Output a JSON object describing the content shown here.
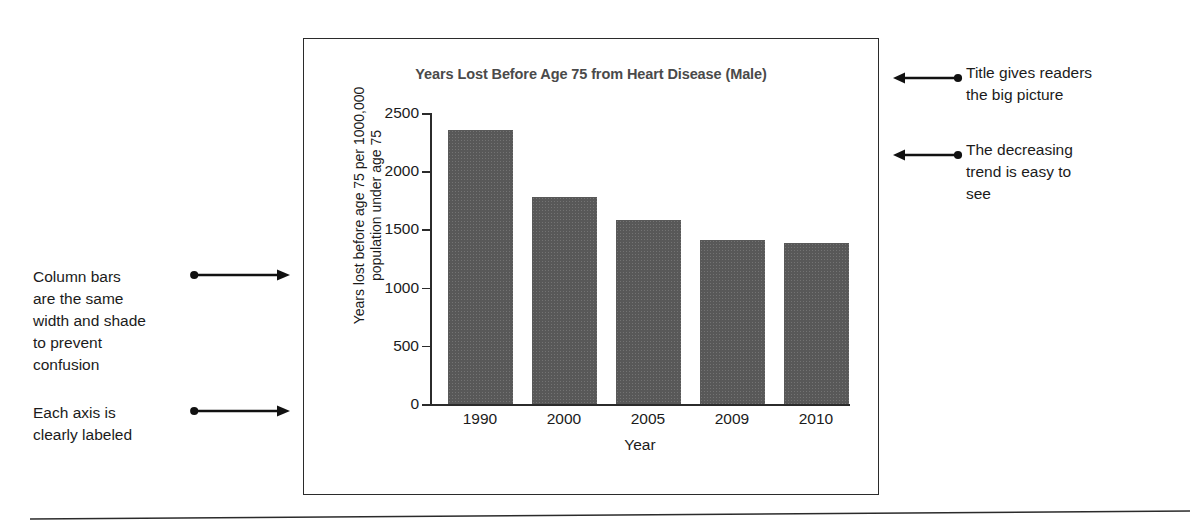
{
  "figure": {
    "chart_title": "Years Lost Before Age 75 from Heart Disease (Male)",
    "y_axis_title_line1": "Years lost before age 75 per 1000,000",
    "y_axis_title_line2": "population under age 75",
    "x_axis_title": "Year",
    "y_ticks": [
      "2500",
      "2000",
      "1500",
      "1000",
      "500",
      "0"
    ],
    "x_ticks": [
      "1990",
      "2000",
      "2005",
      "2009",
      "2010"
    ],
    "bar_color": "#585858",
    "axis_color": "#2b2b2b",
    "border_color": "#2b2b2b"
  },
  "chart_data": {
    "type": "bar",
    "title": "Years Lost Before Age 75 from Heart Disease (Male)",
    "xlabel": "Year",
    "ylabel": "Years lost before age 75 per 1000,000 population under age 75",
    "categories": [
      "1990",
      "2000",
      "2005",
      "2009",
      "2010"
    ],
    "values": [
      2350,
      1780,
      1580,
      1410,
      1380
    ],
    "ylim": [
      0,
      2500
    ],
    "ytick_values": [
      0,
      500,
      1000,
      1500,
      2000,
      2500
    ],
    "grid": false,
    "legend": false,
    "series": [
      {
        "name": "Years lost before age 75 per 1,000,000 population under age 75",
        "values": [
          2350,
          1780,
          1580,
          1410,
          1380
        ]
      }
    ]
  },
  "annotations": {
    "right": [
      {
        "id": "title-callout",
        "lines": [
          "Title gives readers",
          "the big picture"
        ],
        "direction": "left"
      },
      {
        "id": "trend-callout",
        "lines": [
          "The decreasing",
          "trend is easy to",
          "see"
        ],
        "direction": "left"
      }
    ],
    "left": [
      {
        "id": "bars-callout",
        "lines": [
          "Column bars",
          "are the same",
          "width and shade",
          "to prevent",
          "confusion"
        ],
        "direction": "right"
      },
      {
        "id": "axis-callout",
        "lines": [
          "Each axis is",
          "clearly labeled"
        ],
        "direction": "right"
      }
    ]
  }
}
